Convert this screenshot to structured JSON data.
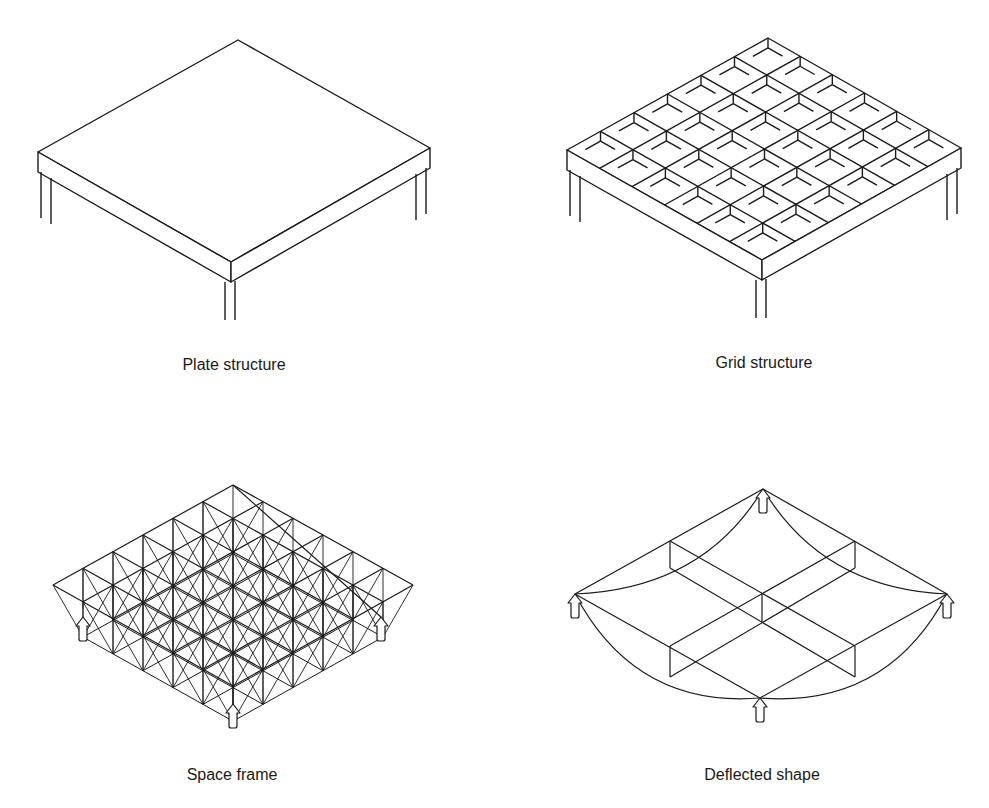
{
  "figure": {
    "panels": [
      {
        "id": "plate",
        "caption": "Plate structure"
      },
      {
        "id": "grid",
        "caption": "Grid structure"
      },
      {
        "id": "space-frame",
        "caption": "Space frame"
      },
      {
        "id": "deflected",
        "caption": "Deflected shape"
      }
    ]
  },
  "style": {
    "stroke": "#1a1a1a",
    "background": "#ffffff"
  },
  "geometry": {
    "plate": {
      "top": [
        238,
        40
      ],
      "left": [
        38,
        152
      ],
      "front": [
        231,
        262
      ],
      "right": [
        430,
        148
      ],
      "thickness": 20
    },
    "grid": {
      "top": [
        768,
        38
      ],
      "left": [
        567,
        150
      ],
      "front": [
        762,
        260
      ],
      "right": [
        961,
        148
      ],
      "thickness": 20,
      "divisions": 6
    },
    "space_frame": {
      "top": [
        233,
        485
      ],
      "left": [
        53,
        585
      ],
      "front": [
        233,
        686
      ],
      "right": [
        413,
        585
      ],
      "divisions": 6,
      "depth": 18
    },
    "deflected": {
      "top": [
        763,
        489
      ],
      "left": [
        575,
        594
      ],
      "right": [
        947,
        594
      ],
      "bottom": [
        760,
        698
      ]
    }
  }
}
